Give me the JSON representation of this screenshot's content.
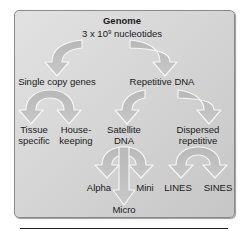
{
  "diagram": {
    "root": {
      "title": "Genome",
      "subtitle_prefix": "3 x 10",
      "subtitle_exponent": "9",
      "subtitle_suffix": " nucleotides"
    },
    "level1": {
      "left": "Single copy genes",
      "right": "Repetitive DNA"
    },
    "level2": {
      "tissue_line1": "Tissue",
      "tissue_line2": "specific",
      "house_line1": "House-",
      "house_line2": "keeping",
      "satellite_line1": "Satellite",
      "satellite_line2": "DNA",
      "dispersed_line1": "Dispersed",
      "dispersed_line2": "repetitive"
    },
    "level3": {
      "alpha": "Alpha",
      "mini": "Mini",
      "micro": "Micro",
      "lines": "LINES",
      "sines": "SINES"
    },
    "colors": {
      "panel_background": "#d6d6d6",
      "arrow_fill": "#c2c2c2",
      "arrow_stroke": "#f4f4f4",
      "text": "#1a1a1a"
    }
  }
}
